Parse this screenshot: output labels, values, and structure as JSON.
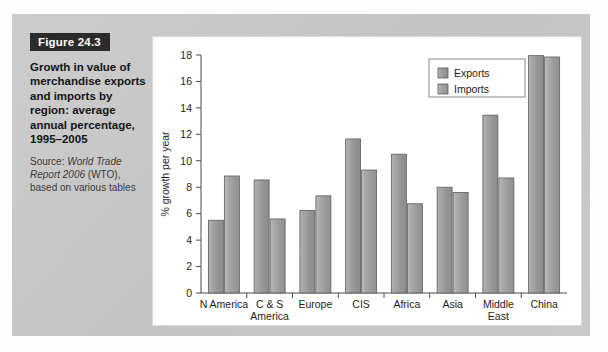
{
  "figure": {
    "badge_label": "Figure 24.3",
    "title": "Growth in value of merchandise exports and imports by region: average annual percentage, 1995–2005",
    "source_prefix": "Source: ",
    "source_italic": "World Trade Report 2006",
    "source_suffix": " (WTO), based on various tables"
  },
  "colors": {
    "exports_bar": "#9a9a9a",
    "imports_bar": "#a2a2a2",
    "bar_outline": "#5d5d5d",
    "axis": "#4a4a4a",
    "panel_bg": "#ffffff",
    "mount_bg": "#c9c9c9",
    "badge_bg": "#2b2b2b",
    "badge_text": "#ffffff"
  },
  "chart_data": {
    "type": "bar",
    "title": "Growth in value of merchandise exports and imports by region: average annual percentage, 1995–2005",
    "xlabel": "",
    "ylabel": "% growth per year",
    "ylim": [
      0,
      18
    ],
    "yticks": [
      0,
      2,
      4,
      6,
      8,
      10,
      12,
      14,
      16,
      18
    ],
    "ytick_labels": [
      "0",
      "2",
      "4",
      "6",
      "8",
      "10",
      "12",
      "14",
      "16",
      "18"
    ],
    "grid": false,
    "legend_position": "upper right",
    "categories": [
      "N America",
      "C & S America",
      "Europe",
      "CIS",
      "Africa",
      "Asia",
      "Middle East",
      "China"
    ],
    "category_label_lines": [
      [
        "N America"
      ],
      [
        "C & S",
        "America"
      ],
      [
        "Europe"
      ],
      [
        "CIS"
      ],
      [
        "Africa"
      ],
      [
        "Asia"
      ],
      [
        "Middle",
        "East"
      ],
      [
        "China"
      ]
    ],
    "series": [
      {
        "name": "Exports",
        "values": [
          5.5,
          8.55,
          6.25,
          11.65,
          10.5,
          8.0,
          13.45,
          17.95
        ]
      },
      {
        "name": "Imports",
        "values": [
          8.85,
          5.6,
          7.35,
          9.3,
          6.75,
          7.6,
          8.7,
          17.85
        ]
      }
    ]
  }
}
